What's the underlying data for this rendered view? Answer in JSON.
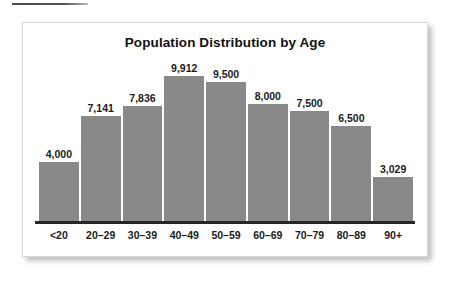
{
  "page": {
    "background_color": "#ffffff",
    "top_rule_color": "#4a4a4a"
  },
  "panel": {
    "border_color": "#d9d9d9",
    "background_color": "#ffffff"
  },
  "chart_data": {
    "type": "bar",
    "title": "Population Distribution by Age",
    "subtitle": "",
    "xlabel": "",
    "ylabel": "",
    "categories": [
      "<20",
      "20–29",
      "30–39",
      "40–49",
      "50–59",
      "60–69",
      "70–79",
      "80–89",
      "90+"
    ],
    "values": [
      4000,
      7141,
      7836,
      9912,
      9500,
      8000,
      7500,
      6500,
      3029
    ],
    "value_labels": [
      "4,000",
      "7,141",
      "7,836",
      "9,912",
      "9,500",
      "8,000",
      "7,500",
      "6,500",
      "3,029"
    ],
    "ylim": [
      0,
      11200
    ],
    "grid": false,
    "legend": false,
    "bar_color": "#898989",
    "axis_color": "#262626",
    "label_color": "#1a1a1a"
  }
}
